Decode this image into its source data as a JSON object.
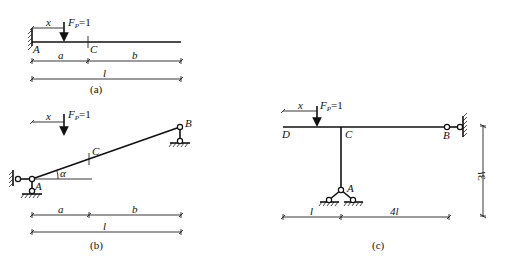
{
  "figure_a": {
    "caption": "(a)",
    "load_label": "F",
    "load_sub": "P",
    "load_value": "=1",
    "x_label": "x",
    "point_A": "A",
    "point_C": "C",
    "dim_a": "a",
    "dim_b": "b",
    "dim_l": "l"
  },
  "figure_b": {
    "caption": "(b)",
    "load_label": "F",
    "load_sub": "P",
    "load_value": "=1",
    "x_label": "x",
    "point_A": "A",
    "point_B": "B",
    "point_C": "C",
    "angle": "α",
    "dim_a": "a",
    "dim_b": "b",
    "dim_l": "l"
  },
  "figure_c": {
    "caption": "(c)",
    "load_label": "F",
    "load_sub": "P",
    "load_value": "=1",
    "x_label": "x",
    "point_A": "A",
    "point_B": "B",
    "point_C": "C",
    "point_D": "D",
    "dim_l": "l",
    "dim_4l": "4l",
    "dim_3l": "3l"
  }
}
